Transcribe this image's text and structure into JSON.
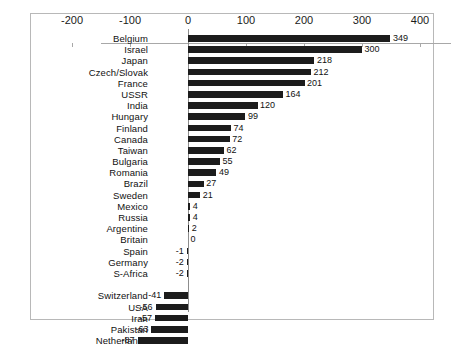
{
  "chart_data": {
    "type": "bar",
    "orientation": "horizontal",
    "title": "",
    "subtitle": "",
    "xlabel": "",
    "ylabel": "",
    "xlim": [
      -200,
      400
    ],
    "xticks": [
      -200,
      -100,
      0,
      100,
      200,
      300,
      400
    ],
    "xtick_labels": [
      "-200",
      "-100",
      "0",
      "100",
      "200",
      "300",
      "400"
    ],
    "grid": false,
    "legend": false,
    "bar_color": "#1c1c1c",
    "categories": [
      "Belgium",
      "Israel",
      "Japan",
      "Czech/Slovak",
      "France",
      "USSR",
      "India",
      "Hungary",
      "Finland",
      "Canada",
      "Taiwan",
      "Bulgaria",
      "Romania",
      "Brazil",
      "Sweden",
      "Mexico",
      "Russia",
      "Argentine",
      "Britain",
      "Spain",
      "Germany",
      "S-Africa",
      "Switzerland",
      "USA",
      "Iran",
      "Pakistan",
      "Netherlands"
    ],
    "values": [
      349,
      300,
      218,
      212,
      201,
      164,
      120,
      99,
      74,
      72,
      62,
      55,
      49,
      27,
      21,
      4,
      4,
      2,
      0,
      -1,
      -2,
      -2,
      -41,
      -56,
      -57,
      -63,
      -87
    ],
    "value_labels": [
      "349",
      "300",
      "218",
      "212",
      "201",
      "164",
      "120",
      "99",
      "74",
      "72",
      "62",
      "55",
      "49",
      "27",
      "21",
      "4",
      "4",
      "2",
      "0",
      "-1",
      "-2",
      "-2",
      "-41",
      "-56",
      "-57",
      "-63",
      "-87"
    ],
    "group_break_after_index": 21
  }
}
